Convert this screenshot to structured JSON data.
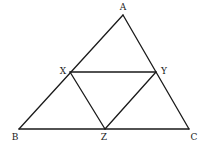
{
  "diagram": {
    "type": "geometry",
    "stroke_color": "#1a1a1a",
    "background": "#ffffff",
    "points": {
      "A": {
        "label": "A",
        "x": 123,
        "y": 15,
        "lx": 123,
        "ly": 10,
        "anchor": "middle"
      },
      "B": {
        "label": "B",
        "x": 19,
        "y": 129,
        "lx": 15,
        "ly": 140,
        "anchor": "middle"
      },
      "C": {
        "label": "C",
        "x": 189,
        "y": 129,
        "lx": 194,
        "ly": 140,
        "anchor": "middle"
      },
      "X": {
        "label": "X",
        "x": 70,
        "y": 72,
        "lx": 63,
        "ly": 74,
        "anchor": "middle"
      },
      "Y": {
        "label": "Y",
        "x": 156,
        "y": 72,
        "lx": 164,
        "ly": 74,
        "anchor": "middle"
      },
      "Z": {
        "label": "Z",
        "x": 105,
        "y": 129,
        "lx": 104,
        "ly": 140,
        "anchor": "middle"
      }
    },
    "segments": [
      [
        "A",
        "B"
      ],
      [
        "B",
        "C"
      ],
      [
        "C",
        "A"
      ],
      [
        "X",
        "Y"
      ],
      [
        "Y",
        "Z"
      ],
      [
        "Z",
        "X"
      ]
    ]
  }
}
